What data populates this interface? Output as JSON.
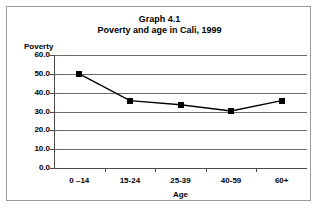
{
  "chart_data": {
    "type": "line",
    "title": "Graph 4.1",
    "subtitle": "Poverty and age in Cali, 1999",
    "xlabel": "Age",
    "ylabel": "Poverty",
    "categories": [
      "0 –14",
      "15-24",
      "25-39",
      "40-59",
      "60+"
    ],
    "values": [
      50.0,
      35.8,
      33.6,
      30.3,
      35.8
    ],
    "yticks": [
      "0.0",
      "10.0",
      "20.0",
      "30.0",
      "40.0",
      "50.0",
      "60.0"
    ],
    "ytick_values": [
      0.0,
      10.0,
      20.0,
      30.0,
      40.0,
      50.0,
      60.0
    ],
    "ylim": [
      0.0,
      60.0
    ],
    "grid": true,
    "legend": false,
    "series": [
      {
        "name": "Poverty",
        "values": [
          50.0,
          35.8,
          33.6,
          30.3,
          35.8
        ],
        "marker": "square",
        "color": "#000000"
      }
    ]
  },
  "figure": {
    "title_line1": "Graph 4.1",
    "title_line2": "Poverty and age in Cali, 1999",
    "y_axis_name": "Poverty",
    "x_axis_name": "Age",
    "border_color": "#9a9a9a",
    "gridline_color": "#6b6b6b",
    "series_color": "#000000"
  }
}
